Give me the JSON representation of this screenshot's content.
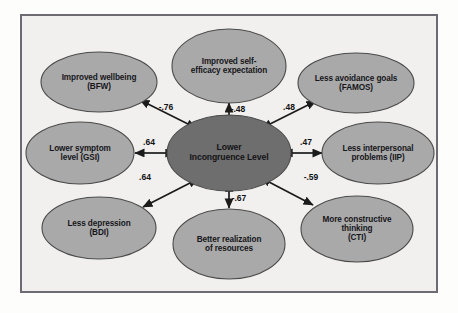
{
  "figure": {
    "background_color": "#f2f0ee",
    "border_color": "#6d6a72",
    "node_fill": "#a9a9a9",
    "center_fill": "#6e6e6e",
    "node_stroke": "#4a4a4a",
    "arrow_color": "#1b1b1b",
    "text_color": "#16161a"
  },
  "diagram": {
    "type": "correlation-network",
    "center": {
      "id": "incongruence",
      "lines": [
        "Lower",
        "Incongruence Level"
      ],
      "cx": 229,
      "cy": 153,
      "rx": 62,
      "ry": 38,
      "fill": "#6e6e6e"
    },
    "nodes": [
      {
        "id": "wellbeing",
        "lines": [
          "Improved wellbeing",
          "(BFW)"
        ],
        "cx": 99,
        "cy": 82,
        "rx": 58,
        "ry": 30,
        "label_font_size": 8.2
      },
      {
        "id": "self-efficacy",
        "lines": [
          "Improved self-",
          "efficacy expectation"
        ],
        "cx": 229,
        "cy": 66,
        "rx": 57,
        "ry": 37,
        "label_font_size": 8.2
      },
      {
        "id": "avoidance-goals",
        "lines": [
          "Less avoidance goals",
          "(FAMOS)"
        ],
        "cx": 356,
        "cy": 83,
        "rx": 58,
        "ry": 30,
        "label_font_size": 8.2
      },
      {
        "id": "symptom-level",
        "lines": [
          "Lower symptom",
          "level (GSI)"
        ],
        "cx": 80,
        "cy": 153,
        "rx": 54,
        "ry": 31,
        "label_font_size": 8.2
      },
      {
        "id": "interpersonal-problems",
        "lines": [
          "Less interpersonal",
          "problems (IIP)"
        ],
        "cx": 378,
        "cy": 153,
        "rx": 56,
        "ry": 31,
        "label_font_size": 8.2
      },
      {
        "id": "depression",
        "lines": [
          "Less depression",
          "(BDI)"
        ],
        "cx": 99,
        "cy": 228,
        "rx": 57,
        "ry": 31,
        "label_font_size": 8.2
      },
      {
        "id": "realization-resources",
        "lines": [
          "Better realization",
          "of resources"
        ],
        "cx": 229,
        "cy": 244,
        "rx": 56,
        "ry": 35,
        "label_font_size": 8.2
      },
      {
        "id": "constructive-thinking",
        "lines": [
          "More constructive",
          "thinking",
          "(CTI)"
        ],
        "cx": 357,
        "cy": 229,
        "rx": 56,
        "ry": 33,
        "label_font_size": 8.2
      }
    ],
    "edges": [
      {
        "id": "edge-wellbeing",
        "from": "incongruence",
        "to": "wellbeing",
        "coefficient": "-.76",
        "label_x": 166,
        "label_y": 107,
        "x1": 188,
        "y1": 124,
        "x2": 140,
        "y2": 100
      },
      {
        "id": "edge-self-efficacy",
        "from": "incongruence",
        "to": "self-efficacy",
        "coefficient": "-.48",
        "label_x": 238,
        "label_y": 109,
        "x1": 229,
        "y1": 116,
        "x2": 229,
        "y2": 103
      },
      {
        "id": "edge-avoidance-goals",
        "from": "incongruence",
        "to": "avoidance-goals",
        "coefficient": ".48",
        "label_x": 289,
        "label_y": 107,
        "x1": 270,
        "y1": 124,
        "x2": 316,
        "y2": 101
      },
      {
        "id": "edge-symptom-level",
        "from": "incongruence",
        "to": "symptom-level",
        "coefficient": ".64",
        "label_x": 149,
        "label_y": 142,
        "x1": 166,
        "y1": 153,
        "x2": 135,
        "y2": 153
      },
      {
        "id": "edge-interpersonal-problems",
        "from": "incongruence",
        "to": "interpersonal-problems",
        "coefficient": ".47",
        "label_x": 306,
        "label_y": 142,
        "x1": 292,
        "y1": 153,
        "x2": 322,
        "y2": 153
      },
      {
        "id": "edge-depression",
        "from": "incongruence",
        "to": "depression",
        "coefficient": ".64",
        "label_x": 145,
        "label_y": 177,
        "x1": 190,
        "y1": 183,
        "x2": 143,
        "y2": 207
      },
      {
        "id": "edge-realization-resources",
        "from": "incongruence",
        "to": "realization-resources",
        "coefficient": "-.67",
        "label_x": 239,
        "label_y": 198,
        "x1": 229,
        "y1": 191,
        "x2": 229,
        "y2": 208
      },
      {
        "id": "edge-constructive-thinking",
        "from": "incongruence",
        "to": "constructive-thinking",
        "coefficient": "-.59",
        "label_x": 311,
        "label_y": 177,
        "x1": 269,
        "y1": 182,
        "x2": 313,
        "y2": 205
      }
    ]
  }
}
